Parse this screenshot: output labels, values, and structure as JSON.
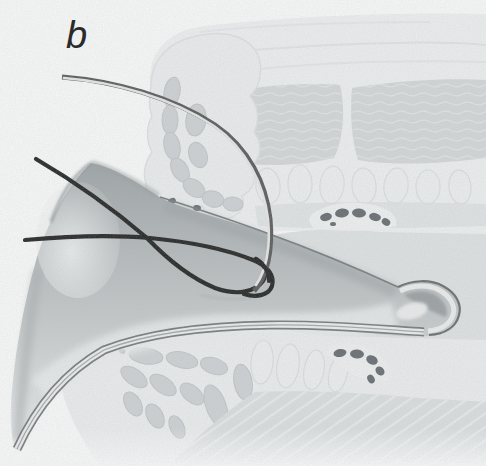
{
  "figure": {
    "label": "b"
  },
  "parts": {
    "needle": "curved surgical needle",
    "suture": "black suture thread",
    "flap": "gray graft flap with curled tip",
    "upper_tissue": "upper tissue cross-section with lobulated mass and muscle bands",
    "lower_tissue": "lower tissue cross-section with fanned lobules and vessels"
  },
  "colors": {
    "paper": "#ffffff",
    "ink": "#2a2a2a",
    "suture": "#141414",
    "needle-dark": "#4f4f4f",
    "needle-light": "#e9e9e9",
    "flap-base": "#b9bdbf",
    "flap-light": "#eff1f1",
    "flap-shadow": "#85898b",
    "tissue-pale": "#f1f3f3",
    "tissue-mid": "#d5d9da",
    "tissue-deep": "#e2e5e6",
    "lobule-fill": "#cfd3d5",
    "lobule-outline": "#c0c5c7",
    "vessel": "#5d6367"
  }
}
